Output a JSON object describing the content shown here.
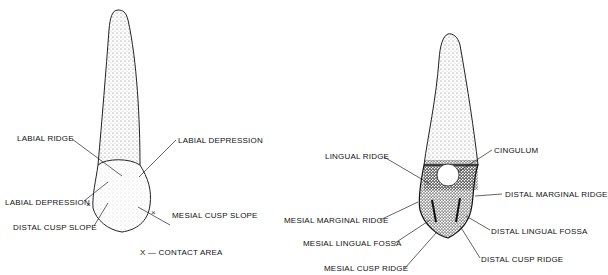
{
  "left_view": {
    "name": "Labial view",
    "labels": {
      "labial_ridge": "LABIAL RIDGE",
      "labial_depression_right": "LABIAL DEPRESSION",
      "labial_depression_left": "LABIAL DEPRESSION",
      "distal_cusp_slope": "DISTAL CUSP SLOPE",
      "mesial_cusp_slope": "MESIAL CUSP SLOPE"
    },
    "contact_mark": "×",
    "legend": "X — CONTACT AREA"
  },
  "right_view": {
    "name": "Lingual view",
    "labels": {
      "lingual_ridge": "LINGUAL RIDGE",
      "cingulum": "CINGULUM",
      "distal_marginal_ridge": "DISTAL MARGINAL RIDGE",
      "mesial_marginal_ridge": "MESIAL MARGINAL RIDGE",
      "distal_lingual_fossa": "DISTAL LINGUAL FOSSA",
      "mesial_lingual_fossa": "MESIAL LINGUAL FOSSA",
      "distal_cusp_ridge": "DISTAL CUSP RIDGE",
      "mesial_cusp_ridge": "MESIAL CUSP RIDGE"
    }
  }
}
